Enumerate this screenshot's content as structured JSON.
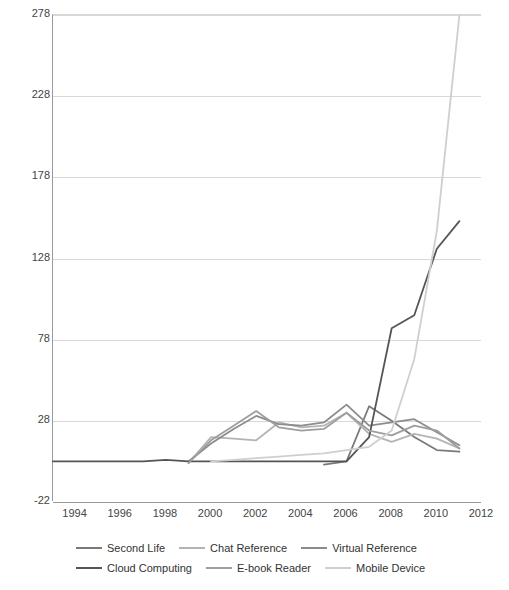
{
  "chart_data": {
    "type": "line",
    "title": "",
    "xlabel": "",
    "ylabel": "",
    "xlim": [
      1993,
      2012
    ],
    "ylim": [
      -22,
      278
    ],
    "yticks": [
      278,
      228,
      178,
      128,
      78,
      28,
      -22
    ],
    "ytick_labels": [
      "278",
      "228",
      "178",
      "128",
      "78",
      "28",
      "-22"
    ],
    "xticks": [
      1994,
      1996,
      1998,
      2000,
      2002,
      2004,
      2006,
      2008,
      2010,
      2012
    ],
    "xtick_labels": [
      "1994",
      "1996",
      "1998",
      "2000",
      "2002",
      "2004",
      "2006",
      "2008",
      "2010",
      "2012"
    ],
    "grid": true,
    "legend_position": "bottom",
    "x": [
      1993,
      1994,
      1995,
      1996,
      1997,
      1998,
      1999,
      2000,
      2001,
      2002,
      2003,
      2004,
      2005,
      2006,
      2007,
      2008,
      2009,
      2010,
      2011
    ],
    "series": [
      {
        "name": "Second Life",
        "color": "#7a7a7a",
        "x": [
          2005,
          2006,
          2007,
          2008,
          2009,
          2010,
          2011
        ],
        "values": [
          1,
          3,
          37,
          28,
          18,
          10,
          9
        ]
      },
      {
        "name": "Chat Reference",
        "color": "#b4b4b4",
        "x": [
          1999,
          2000,
          2001,
          2002,
          2003,
          2004,
          2005,
          2006,
          2007,
          2008,
          2009,
          2010,
          2011
        ],
        "values": [
          2,
          18,
          17,
          16,
          27,
          24,
          25,
          33,
          20,
          15,
          20,
          17,
          11
        ]
      },
      {
        "name": "Virtual Reference",
        "color": "#8c8c8c",
        "x": [
          1999,
          2000,
          2001,
          2002,
          2003,
          2004,
          2005,
          2006,
          2007,
          2008,
          2009,
          2010,
          2011
        ],
        "values": [
          3,
          14,
          23,
          31,
          26,
          25,
          27,
          38,
          25,
          27,
          29,
          21,
          13
        ]
      },
      {
        "name": "Cloud Computing",
        "color": "#555555",
        "x": [
          1993,
          1994,
          1995,
          1996,
          1997,
          1998,
          1999,
          2000,
          2001,
          2002,
          2003,
          2004,
          2005,
          2006,
          2007,
          2008,
          2009,
          2010,
          2011
        ],
        "values": [
          3,
          3,
          3,
          3,
          3,
          4,
          3,
          3,
          3,
          3,
          3,
          3,
          3,
          3,
          18,
          85,
          93,
          134,
          151
        ]
      },
      {
        "name": "E-book Reader",
        "color": "#9e9e9e",
        "x": [
          1999,
          2000,
          2001,
          2002,
          2003,
          2004,
          2005,
          2006,
          2007,
          2008,
          2009,
          2010,
          2011
        ],
        "values": [
          2,
          16,
          25,
          34,
          24,
          22,
          23,
          33,
          22,
          19,
          25,
          22,
          11
        ]
      },
      {
        "name": "Mobile Device",
        "color": "#cfcfcf",
        "x": [
          2000,
          2001,
          2002,
          2003,
          2004,
          2005,
          2006,
          2007,
          2008,
          2009,
          2010,
          2011
        ],
        "values": [
          3,
          4,
          5,
          6,
          7,
          8,
          10,
          12,
          22,
          66,
          145,
          278
        ]
      }
    ]
  },
  "legend": {
    "rows": [
      [
        {
          "label": "Second Life",
          "color": "#7a7a7a"
        },
        {
          "label": "Chat Reference",
          "color": "#b4b4b4"
        },
        {
          "label": "Virtual Reference",
          "color": "#8c8c8c"
        }
      ],
      [
        {
          "label": "Cloud Computing",
          "color": "#555555"
        },
        {
          "label": "E-book Reader",
          "color": "#9e9e9e"
        },
        {
          "label": "Mobile Device",
          "color": "#cfcfcf"
        }
      ]
    ]
  }
}
